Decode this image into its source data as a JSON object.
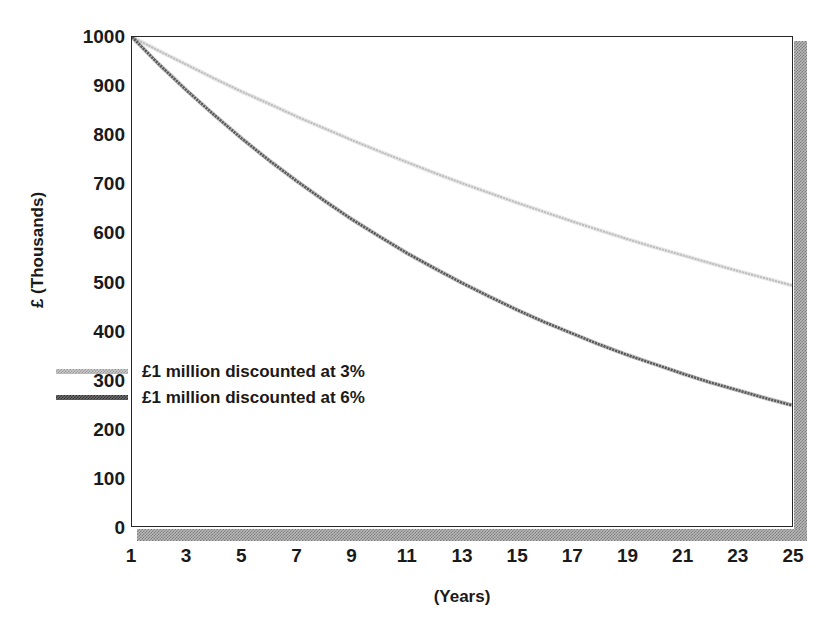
{
  "chart_data": {
    "type": "line",
    "title": "",
    "xlabel": "(Years)",
    "ylabel": "£ (Thousands)",
    "xlim": [
      1,
      25
    ],
    "ylim": [
      0,
      1000
    ],
    "grid": false,
    "legend_position": "inside-left",
    "x": [
      1,
      2,
      3,
      4,
      5,
      6,
      7,
      8,
      9,
      10,
      11,
      12,
      13,
      14,
      15,
      16,
      17,
      18,
      19,
      20,
      21,
      22,
      23,
      24,
      25
    ],
    "xtick_labels": [
      "1",
      "3",
      "5",
      "7",
      "9",
      "11",
      "13",
      "15",
      "17",
      "19",
      "21",
      "23",
      "25"
    ],
    "xtick_values": [
      1,
      3,
      5,
      7,
      9,
      11,
      13,
      15,
      17,
      19,
      21,
      23,
      25
    ],
    "ytick_labels": [
      "0",
      "100",
      "200",
      "300",
      "400",
      "500",
      "600",
      "700",
      "800",
      "900",
      "1000"
    ],
    "ytick_values": [
      0,
      100,
      200,
      300,
      400,
      500,
      600,
      700,
      800,
      900,
      1000
    ],
    "series": [
      {
        "name": "£1 million discounted at 3%",
        "color": "#bdbdbd",
        "values": [
          1000,
          971,
          943,
          915,
          888,
          863,
          837,
          813,
          789,
          766,
          744,
          722,
          701,
          681,
          661,
          642,
          623,
          605,
          587,
          570,
          554,
          538,
          522,
          507,
          492
        ]
      },
      {
        "name": "£1 million discounted at 6%",
        "color": "#595959",
        "values": [
          1000,
          943,
          890,
          840,
          792,
          747,
          705,
          665,
          627,
          592,
          558,
          527,
          497,
          469,
          442,
          417,
          394,
          371,
          350,
          331,
          312,
          294,
          278,
          262,
          247
        ]
      }
    ]
  },
  "legend": {
    "items": [
      {
        "label": "£1 million discounted at 3%",
        "swatch": "light"
      },
      {
        "label": "£1 million discounted at 6%",
        "swatch": "dark"
      }
    ]
  },
  "axes": {
    "y_title": "£ (Thousands)",
    "x_title": "(Years)"
  }
}
